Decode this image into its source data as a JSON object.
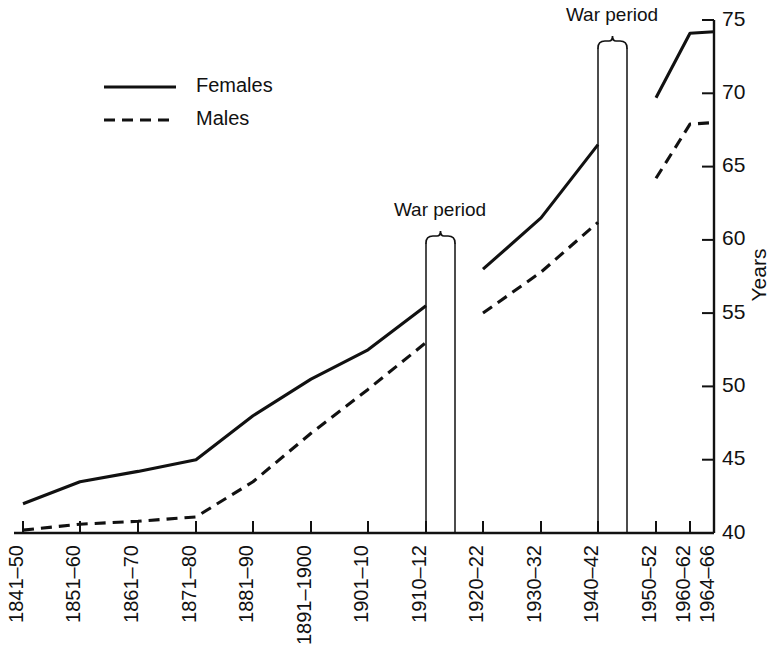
{
  "chart_data": {
    "type": "line",
    "title": "",
    "subtitle": "",
    "xlabel": "",
    "ylabel": "Years",
    "ylim": [
      40,
      75
    ],
    "yticks": [
      40,
      45,
      50,
      55,
      60,
      65,
      70,
      75
    ],
    "ytick_labels": [
      "40",
      "45",
      "50",
      "55",
      "60",
      "65",
      "70",
      "75"
    ],
    "y_axis_position": "right",
    "grid": false,
    "legend_position": "upper-left",
    "categories": [
      "1841–50",
      "1851–60",
      "1861–70",
      "1871–80",
      "1881–90",
      "1891–1900",
      "1901–10",
      "1910–12",
      "1920–22",
      "1930–32",
      "1940–42",
      "1950–52",
      "1960–62",
      "1964–66"
    ],
    "series": [
      {
        "name": "Females",
        "style": "solid",
        "color": "#111111",
        "values": [
          42.0,
          43.5,
          44.2,
          45.0,
          48.0,
          50.5,
          52.5,
          55.5,
          58.0,
          61.5,
          66.5,
          69.7,
          74.1,
          74.2
        ]
      },
      {
        "name": "Males",
        "style": "dashed",
        "color": "#111111",
        "values": [
          40.2,
          40.6,
          40.8,
          41.1,
          43.5,
          46.8,
          49.8,
          53.0,
          55.0,
          57.8,
          61.2,
          64.2,
          67.9,
          68.0
        ]
      }
    ],
    "breaks": [
      {
        "after_category": "1910–12",
        "before_category": "1920–22",
        "label": "War period"
      },
      {
        "after_category": "1940–42",
        "before_category": "1950–52",
        "label": "War period"
      }
    ],
    "annotations": [
      {
        "text": "War period",
        "near_categories": [
          "1910–12",
          "1920–22"
        ]
      },
      {
        "text": "War period",
        "near_categories": [
          "1940–42",
          "1950–52"
        ]
      }
    ]
  },
  "legend": {
    "items": [
      {
        "label": "Females",
        "style": "solid"
      },
      {
        "label": "Males",
        "style": "dashed"
      }
    ]
  },
  "axes": {
    "y_title": "Years"
  }
}
